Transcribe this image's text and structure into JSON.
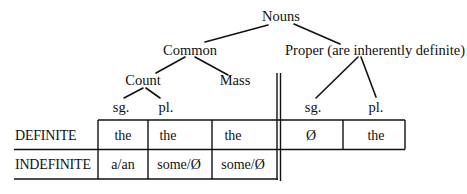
{
  "tree": {
    "root": "Nouns",
    "common": "Common",
    "proper": "Proper (are inherently definite)",
    "count": "Count",
    "mass": "Mass",
    "count_sg": "sg.",
    "count_pl": "pl.",
    "proper_sg": "sg.",
    "proper_pl": "pl."
  },
  "table": {
    "rows": [
      {
        "label": "DEFINITE",
        "cells": [
          "the",
          "the",
          "the",
          "Ø",
          "the"
        ]
      },
      {
        "label": "INDEFINITE",
        "cells": [
          "a/an",
          "some/Ø",
          "some/Ø"
        ]
      }
    ]
  }
}
